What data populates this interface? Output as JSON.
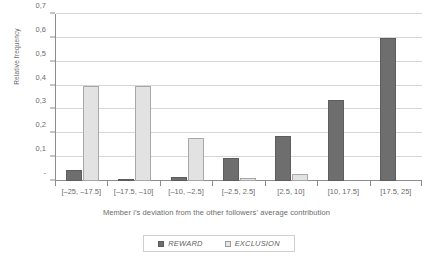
{
  "chart_data": {
    "type": "bar",
    "title": "",
    "xlabel": "Member i’s deviation from the other followers’ average contribution",
    "ylabel": "Relative frequency",
    "categories": [
      "[–25, –17.5]",
      "[–17.5, –10]",
      "[–10, –2.5]",
      "[–2.5, 2.5]",
      "[2.5, 10]",
      "[10, 17.5]",
      "[17.5, 25]"
    ],
    "series": [
      {
        "name": "REWARD",
        "values": [
          0.045,
          0.01,
          0.015,
          0.095,
          0.19,
          0.34,
          0.6
        ],
        "color": "#6e6e6e"
      },
      {
        "name": "EXCLUSION",
        "values": [
          0.4,
          0.4,
          0.18,
          0.012,
          0.03,
          0.0,
          0.0
        ],
        "color": "#e2e2e2"
      }
    ],
    "ylim": [
      0,
      0.7
    ],
    "ytick_values": [
      0.0,
      0.1,
      0.2,
      0.3,
      0.4,
      0.5,
      0.6,
      0.7
    ],
    "ytick_labels": [
      "-",
      "0,1",
      "0,2",
      "0,3",
      "0,4",
      "0,5",
      "0,6",
      "0,7"
    ],
    "grid": true,
    "legend_position": "bottom-center",
    "decimal_separator": ","
  },
  "legend": {
    "items": [
      {
        "label": "REWARD"
      },
      {
        "label": "EXCLUSION"
      }
    ]
  }
}
